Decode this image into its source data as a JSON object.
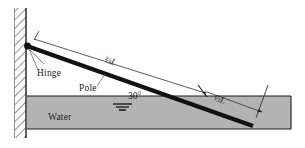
{
  "figure": {
    "labels": {
      "hinge": "Hinge",
      "pole": "Pole",
      "water": "Water",
      "angle": "30°",
      "upper_length": "⅔L",
      "lower_length": "⅓L"
    },
    "colors": {
      "background": "#ffffff",
      "water_fill": "#b3b3b3",
      "water_edge": "#1a1a1a",
      "pole": "#111111",
      "wall_line": "#1a1a1a",
      "hatch": "#444444",
      "dimension_line": "#333333",
      "leader_line": "#555555"
    },
    "geometry": {
      "wall_x": 26,
      "wall_top_y": 8,
      "wall_bottom_y": 138,
      "hinge_point": [
        27,
        46
      ],
      "pole_end_point": [
        253,
        126
      ],
      "water_surface_y": 96,
      "water_right_x": 291,
      "water_bottom_y": 129,
      "dimension_split_point": [
        202,
        92
      ],
      "angle_degrees": 30
    }
  }
}
